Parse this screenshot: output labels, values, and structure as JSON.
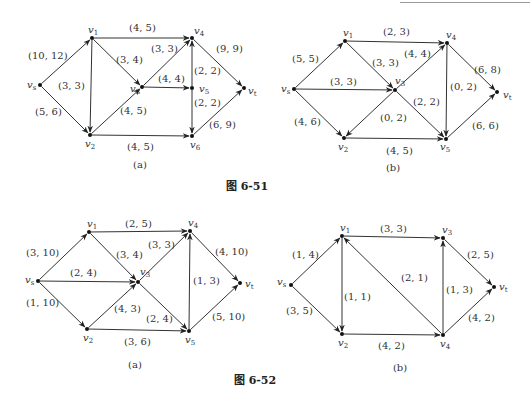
{
  "figures": [
    {
      "caption": "图  6-51",
      "caption_pos": [
        247,
        190
      ],
      "panels": [
        {
          "label": "(a)",
          "label_pos": [
            140,
            168
          ],
          "nodes": [
            {
              "id": "vs",
              "name": "v",
              "sub": "s",
              "x": 40,
              "y": 85,
              "lx": 27,
              "ly": 88
            },
            {
              "id": "v1",
              "name": "v",
              "sub": "1",
              "x": 92,
              "y": 38,
              "lx": 88,
              "ly": 33
            },
            {
              "id": "v2",
              "name": "v",
              "sub": "2",
              "x": 90,
              "y": 135,
              "lx": 85,
              "ly": 147
            },
            {
              "id": "v3",
              "name": "v",
              "sub": "3",
              "x": 142,
              "y": 87,
              "lx": 130,
              "ly": 92
            },
            {
              "id": "v4",
              "name": "v",
              "sub": "4",
              "x": 192,
              "y": 38,
              "lx": 194,
              "ly": 34
            },
            {
              "id": "v5",
              "name": "v",
              "sub": "5",
              "x": 192,
              "y": 88,
              "lx": 199,
              "ly": 92
            },
            {
              "id": "v6",
              "name": "v",
              "sub": "6",
              "x": 192,
              "y": 136,
              "lx": 190,
              "ly": 148
            },
            {
              "id": "vt",
              "name": "v",
              "sub": "t",
              "x": 244,
              "y": 88,
              "lx": 248,
              "ly": 94
            }
          ],
          "edges": [
            {
              "from": "vs",
              "to": "v1",
              "label": "(10, 12)",
              "lx": 28,
              "ly": 59
            },
            {
              "from": "vs",
              "to": "v2",
              "label": "(5, 6)",
              "lx": 35,
              "ly": 115
            },
            {
              "from": "v1",
              "to": "v2",
              "label": "(3, 3)",
              "lx": 58,
              "ly": 89
            },
            {
              "from": "v1",
              "to": "v4",
              "label": "(4, 5)",
              "lx": 129,
              "ly": 31
            },
            {
              "from": "v1",
              "to": "v3",
              "label": "(3, 4)",
              "lx": 116,
              "ly": 63
            },
            {
              "from": "v2",
              "to": "v3",
              "label": "(4, 5)",
              "lx": 120,
              "ly": 114
            },
            {
              "from": "v2",
              "to": "v6",
              "label": "(4, 5)",
              "lx": 127,
              "ly": 150
            },
            {
              "from": "v3",
              "to": "v4",
              "label": "(3, 3)",
              "lx": 151,
              "ly": 52
            },
            {
              "from": "v3",
              "to": "v5",
              "label": "(4, 4)",
              "lx": 158,
              "ly": 82
            },
            {
              "from": "v5",
              "to": "v4",
              "label": "(2, 2)",
              "lx": 194,
              "ly": 74
            },
            {
              "from": "v5",
              "to": "v6",
              "label": "(2, 2)",
              "lx": 194,
              "ly": 106
            },
            {
              "from": "v4",
              "to": "vt",
              "label": "(9, 9)",
              "lx": 216,
              "ly": 52
            },
            {
              "from": "v6",
              "to": "vt",
              "label": "(6, 9)",
              "lx": 209,
              "ly": 128
            }
          ]
        },
        {
          "label": "(b)",
          "label_pos": [
            393,
            171
          ],
          "nodes": [
            {
              "id": "vs",
              "name": "v",
              "sub": "s",
              "x": 294,
              "y": 89,
              "lx": 281,
              "ly": 92
            },
            {
              "id": "v1",
              "name": "v",
              "sub": "1",
              "x": 345,
              "y": 41,
              "lx": 343,
              "ly": 36
            },
            {
              "id": "v2",
              "name": "v",
              "sub": "2",
              "x": 344,
              "y": 138,
              "lx": 338,
              "ly": 150
            },
            {
              "id": "v3",
              "name": "v",
              "sub": "3",
              "x": 395,
              "y": 90,
              "lx": 395,
              "ly": 84
            },
            {
              "id": "v4",
              "name": "v",
              "sub": "4",
              "x": 447,
              "y": 43,
              "lx": 446,
              "ly": 38
            },
            {
              "id": "v5",
              "name": "v",
              "sub": "5",
              "x": 446,
              "y": 139,
              "lx": 440,
              "ly": 150
            },
            {
              "id": "vt",
              "name": "v",
              "sub": "t",
              "x": 497,
              "y": 92,
              "lx": 503,
              "ly": 98
            }
          ],
          "edges": [
            {
              "from": "vs",
              "to": "v1",
              "label": "(5, 5)",
              "lx": 292,
              "ly": 62
            },
            {
              "from": "vs",
              "to": "v3",
              "label": "(3, 3)",
              "lx": 330,
              "ly": 85
            },
            {
              "from": "vs",
              "to": "v2",
              "label": "(4, 6)",
              "lx": 294,
              "ly": 125
            },
            {
              "from": "v1",
              "to": "v4",
              "label": "(2, 3)",
              "lx": 383,
              "ly": 35
            },
            {
              "from": "v1",
              "to": "v3",
              "label": "(3, 3)",
              "lx": 372,
              "ly": 66
            },
            {
              "from": "v3",
              "to": "v4",
              "label": "(4, 4)",
              "lx": 404,
              "ly": 57
            },
            {
              "from": "v3",
              "to": "v2",
              "label": "(0, 2)",
              "lx": 380,
              "ly": 121
            },
            {
              "from": "v3",
              "to": "v5",
              "label": "(2, 2)",
              "lx": 413,
              "ly": 105
            },
            {
              "from": "v2",
              "to": "v5",
              "label": "(4, 5)",
              "lx": 386,
              "ly": 154
            },
            {
              "from": "v4",
              "to": "v5",
              "label": "(0, 2)",
              "lx": 450,
              "ly": 90
            },
            {
              "from": "v4",
              "to": "vt",
              "label": "(6, 8)",
              "lx": 474,
              "ly": 73
            },
            {
              "from": "v5",
              "to": "vt",
              "label": "(6, 6)",
              "lx": 472,
              "ly": 129
            }
          ]
        }
      ]
    },
    {
      "caption": "图  6-52",
      "caption_pos": [
        255,
        384
      ],
      "panels": [
        {
          "label": "(a)",
          "label_pos": [
            135,
            368
          ],
          "nodes": [
            {
              "id": "vs",
              "name": "v",
              "sub": "s",
              "x": 38,
              "y": 281,
              "lx": 25,
              "ly": 283
            },
            {
              "id": "v1",
              "name": "v",
              "sub": "1",
              "x": 89,
              "y": 232,
              "lx": 87,
              "ly": 227
            },
            {
              "id": "v2",
              "name": "v",
              "sub": "2",
              "x": 87,
              "y": 329,
              "lx": 83,
              "ly": 341
            },
            {
              "id": "v3",
              "name": "v",
              "sub": "3",
              "x": 138,
              "y": 282,
              "lx": 140,
              "ly": 275
            },
            {
              "id": "v4",
              "name": "v",
              "sub": "4",
              "x": 190,
              "y": 231,
              "lx": 188,
              "ly": 226
            },
            {
              "id": "v5",
              "name": "v",
              "sub": "5",
              "x": 189,
              "y": 331,
              "lx": 185,
              "ly": 343
            },
            {
              "id": "vt",
              "name": "v",
              "sub": "t",
              "x": 240,
              "y": 283,
              "lx": 245,
              "ly": 287
            }
          ],
          "edges": [
            {
              "from": "vs",
              "to": "v1",
              "label": "(3, 10)",
              "lx": 26,
              "ly": 256
            },
            {
              "from": "vs",
              "to": "v3",
              "label": "(2, 4)",
              "lx": 70,
              "ly": 276
            },
            {
              "from": "vs",
              "to": "v2",
              "label": "(1, 10)",
              "lx": 26,
              "ly": 306
            },
            {
              "from": "v1",
              "to": "v4",
              "label": "(2, 5)",
              "lx": 125,
              "ly": 227
            },
            {
              "from": "v1",
              "to": "v3",
              "label": "(3, 4)",
              "lx": 116,
              "ly": 258
            },
            {
              "from": "v2",
              "to": "v3",
              "label": "(4, 3)",
              "lx": 114,
              "ly": 312
            },
            {
              "from": "v2",
              "to": "v5",
              "label": "(3, 6)",
              "lx": 124,
              "ly": 345
            },
            {
              "from": "v3",
              "to": "v4",
              "label": "(3, 3)",
              "lx": 148,
              "ly": 248
            },
            {
              "from": "v3",
              "to": "v5",
              "label": "(2, 4)",
              "lx": 146,
              "ly": 322
            },
            {
              "from": "v5",
              "to": "v4",
              "label": "(1, 3)",
              "lx": 193,
              "ly": 284
            },
            {
              "from": "v4",
              "to": "vt",
              "label": "(4, 10)",
              "lx": 215,
              "ly": 255
            },
            {
              "from": "v5",
              "to": "vt",
              "label": "(5, 10)",
              "lx": 212,
              "ly": 320
            }
          ]
        },
        {
          "label": "(b)",
          "label_pos": [
            400,
            371
          ],
          "nodes": [
            {
              "id": "vs",
              "name": "v",
              "sub": "s",
              "x": 291,
              "y": 285,
              "lx": 277,
              "ly": 285
            },
            {
              "id": "v1",
              "name": "v",
              "sub": "1",
              "x": 342,
              "y": 236,
              "lx": 340,
              "ly": 231
            },
            {
              "id": "v2",
              "name": "v",
              "sub": "2",
              "x": 342,
              "y": 334,
              "lx": 338,
              "ly": 346
            },
            {
              "id": "v3",
              "name": "v",
              "sub": "3",
              "x": 443,
              "y": 238,
              "lx": 442,
              "ly": 233
            },
            {
              "id": "v4",
              "name": "v",
              "sub": "4",
              "x": 443,
              "y": 335,
              "lx": 440,
              "ly": 347
            },
            {
              "id": "vt",
              "name": "v",
              "sub": "t",
              "x": 494,
              "y": 287,
              "lx": 499,
              "ly": 290
            }
          ],
          "edges": [
            {
              "from": "vs",
              "to": "v1",
              "label": "(1, 4)",
              "lx": 292,
              "ly": 258
            },
            {
              "from": "vs",
              "to": "v2",
              "label": "(3, 5)",
              "lx": 286,
              "ly": 314
            },
            {
              "from": "v1",
              "to": "v3",
              "label": "(3, 3)",
              "lx": 380,
              "ly": 232
            },
            {
              "from": "v1",
              "to": "v2",
              "label": "(1, 1)",
              "lx": 344,
              "ly": 300
            },
            {
              "from": "v4",
              "to": "v1",
              "label": "(2, 1)",
              "lx": 401,
              "ly": 281
            },
            {
              "from": "v2",
              "to": "v4",
              "label": "(4, 2)",
              "lx": 378,
              "ly": 349
            },
            {
              "from": "v4",
              "to": "v3",
              "label": "(1, 3)",
              "lx": 446,
              "ly": 293
            },
            {
              "from": "v3",
              "to": "vt",
              "label": "(2, 5)",
              "lx": 467,
              "ly": 258
            },
            {
              "from": "v4",
              "to": "vt",
              "label": "(4, 2)",
              "lx": 468,
              "ly": 321
            }
          ]
        }
      ]
    }
  ]
}
